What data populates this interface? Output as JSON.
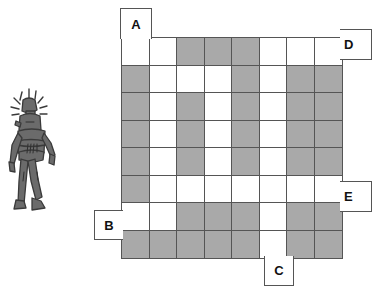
{
  "page": {
    "background_color": "#ffffff"
  },
  "figure": {
    "name": "robot-figure",
    "body_color": "#6b6b6b",
    "outline_color": "#3a3a3a"
  },
  "grid": {
    "rows": 8,
    "columns": 8,
    "cell_size_px": 27.5,
    "filled_color": "#a9a9a9",
    "empty_color": "#ffffff",
    "border_color": "#555555",
    "cells": [
      [
        "empty",
        "empty",
        "filled",
        "filled",
        "filled",
        "empty",
        "empty",
        "empty"
      ],
      [
        "filled",
        "empty",
        "empty",
        "empty",
        "filled",
        "empty",
        "filled",
        "filled"
      ],
      [
        "filled",
        "empty",
        "filled",
        "empty",
        "filled",
        "empty",
        "filled",
        "filled"
      ],
      [
        "filled",
        "empty",
        "filled",
        "empty",
        "filled",
        "empty",
        "filled",
        "filled"
      ],
      [
        "filled",
        "empty",
        "filled",
        "empty",
        "filled",
        "empty",
        "filled",
        "filled"
      ],
      [
        "filled",
        "empty",
        "empty",
        "empty",
        "empty",
        "empty",
        "empty",
        "empty"
      ],
      [
        "empty",
        "empty",
        "filled",
        "filled",
        "filled",
        "empty",
        "filled",
        "filled"
      ],
      [
        "filled",
        "filled",
        "filled",
        "filled",
        "filled",
        "empty",
        "filled",
        "filled"
      ]
    ]
  },
  "labels": {
    "a": "A",
    "b": "B",
    "c": "C",
    "d": "D",
    "e": "E"
  }
}
